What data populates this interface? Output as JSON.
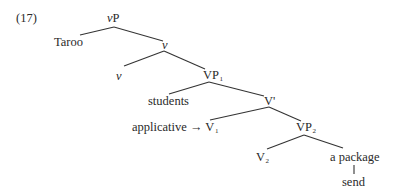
{
  "example_number": "(17)",
  "tree": {
    "root": {
      "cat": "v",
      "suffix": "P"
    },
    "specifier": "Taroo",
    "v_bar": {
      "cat": "v"
    },
    "v_head": {
      "cat": "v"
    },
    "vp1": {
      "cat": "VP",
      "sub": "1"
    },
    "vp1_spec": "students",
    "v_prime": {
      "cat": "V'"
    },
    "v1": {
      "prefix": "applicative → ",
      "cat": "V",
      "sub": "1"
    },
    "vp2": {
      "cat": "VP",
      "sub": "2"
    },
    "v2": {
      "cat": "V",
      "sub": "2"
    },
    "object": "a package",
    "verb": "send"
  },
  "colors": {
    "line": "#333333",
    "text": "#2a2a2a",
    "background": "#ffffff"
  }
}
